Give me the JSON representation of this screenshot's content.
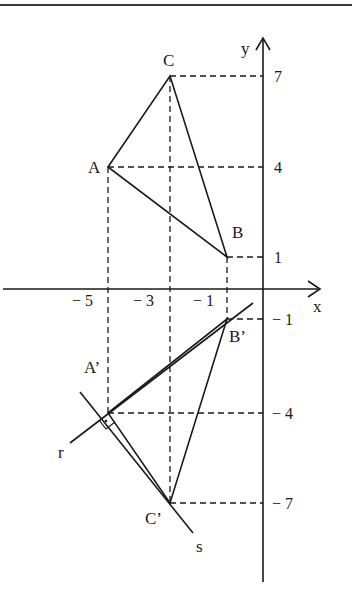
{
  "diagram": {
    "type": "coordinate-geometry",
    "axes": {
      "x_label": "x",
      "y_label": "y"
    },
    "x_ticks": [
      "− 5",
      "− 3",
      "− 1"
    ],
    "y_ticks_pos": [
      "7",
      "4",
      "1"
    ],
    "y_ticks_neg": [
      "− 1",
      "− 4",
      "− 7"
    ],
    "points": {
      "A": {
        "label": "A",
        "coords": [
          -5,
          4
        ]
      },
      "B": {
        "label": "B",
        "coords": [
          -1,
          1
        ]
      },
      "C": {
        "label": "C",
        "coords": [
          -3,
          7
        ]
      },
      "A_prime": {
        "label": "A’",
        "coords": [
          -5,
          -4
        ]
      },
      "B_prime": {
        "label": "B’",
        "coords": [
          -1,
          -1
        ]
      },
      "C_prime": {
        "label": "C’",
        "coords": [
          -3,
          -7
        ]
      }
    },
    "lines": {
      "r": "r",
      "s": "s"
    },
    "right_angle_marker": "r ⟂ s at A’"
  }
}
